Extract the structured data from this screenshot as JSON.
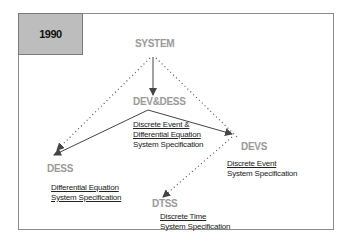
{
  "year": "1990",
  "nodes": {
    "system": {
      "label": "SYSTEM"
    },
    "devdess": {
      "label": "DEV&DESS",
      "desc": [
        "Discrete Event &",
        "Differential Equation",
        "System Specification"
      ]
    },
    "dess": {
      "label": "DESS",
      "desc": [
        "Differential Equation",
        "System Specification"
      ]
    },
    "devs": {
      "label": "DEVS",
      "desc": [
        "Discrete Event",
        "System Specification"
      ]
    },
    "dtss": {
      "label": "DTSS",
      "desc": [
        "Discrete Time",
        "System Specification"
      ]
    }
  },
  "colors": {
    "node_label": "#9a9a9a",
    "year_box": "#bdbdbd",
    "arrow": "#444444"
  }
}
